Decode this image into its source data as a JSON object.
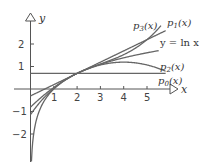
{
  "chart_data": {
    "type": "line",
    "title": "",
    "xlabel": "x",
    "ylabel": "y",
    "xlim": [
      0,
      6
    ],
    "ylim": [
      -3,
      3
    ],
    "grid": false,
    "x_ticks": [
      "1",
      "2",
      "3",
      "4",
      "5"
    ],
    "y_ticks": [
      "2",
      "1",
      "-1",
      "-2"
    ],
    "center": 2,
    "series": [
      {
        "name": "y = ln x",
        "label": "y = ln x",
        "expr": "ln(x)"
      },
      {
        "name": "p0(x)",
        "label": "p0(x)",
        "expr": "ln(2)"
      },
      {
        "name": "p1(x)",
        "label": "p1(x)",
        "expr": "ln(2) + (x-2)/2"
      },
      {
        "name": "p2(x)",
        "label": "p2(x)",
        "expr": "ln(2) + (x-2)/2 - (x-2)^2/8"
      },
      {
        "name": "p3(x)",
        "label": "p3(x)",
        "expr": "ln(2) + (x-2)/2 - (x-2)^2/8 + (x-2)^3/24"
      }
    ],
    "annotations": [
      "p3(x)",
      "p1(x)",
      "y = ln x",
      "p2(x)",
      "p0(x)"
    ]
  },
  "labels": {
    "x_axis": "x",
    "y_axis": "y",
    "p3": "p",
    "p3_sub": "3",
    "p1": "p",
    "p1_sub": "1",
    "p2": "p",
    "p2_sub": "2",
    "p0": "p",
    "p0_sub": "0",
    "fx": "(x)",
    "ln": "y = ln x",
    "tick_x1": "1",
    "tick_x2": "2",
    "tick_x3": "3",
    "tick_x4": "4",
    "tick_x5": "5",
    "tick_y2": "2",
    "tick_y1": "1",
    "tick_ym1": "−1",
    "tick_ym2": "−2"
  },
  "colors": {
    "axis": "#555555",
    "curve": "#666666"
  }
}
